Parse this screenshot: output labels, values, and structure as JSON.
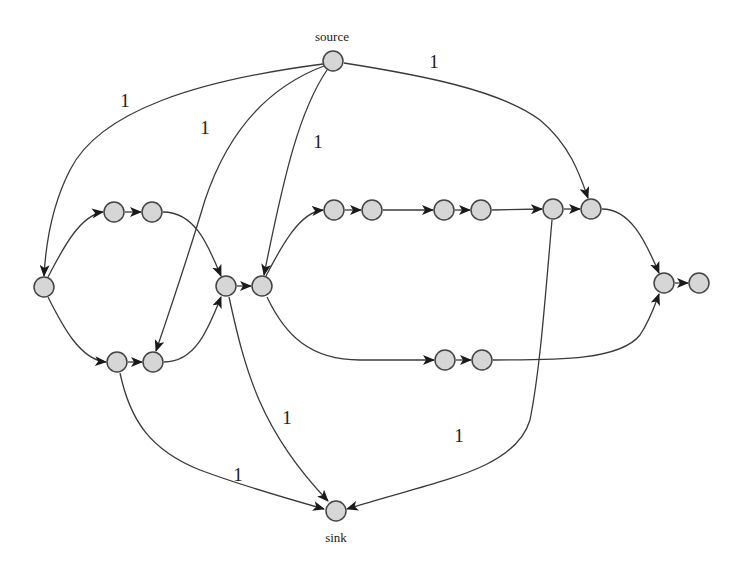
{
  "diagram": {
    "type": "directed-graph",
    "colors": {
      "node_fill": "#d6d6d6",
      "node_stroke": "#444444",
      "edge": "#3a3a3a",
      "background": "#ffffff"
    },
    "nodes": [
      {
        "id": "source",
        "label": "source",
        "x": 333,
        "y": 61
      },
      {
        "id": "a",
        "label": "",
        "x": 44,
        "y": 287
      },
      {
        "id": "b1",
        "label": "",
        "x": 114,
        "y": 212
      },
      {
        "id": "b2",
        "label": "",
        "x": 152,
        "y": 212
      },
      {
        "id": "c1",
        "label": "",
        "x": 117,
        "y": 362
      },
      {
        "id": "c2",
        "label": "",
        "x": 153,
        "y": 362
      },
      {
        "id": "d",
        "label": "",
        "x": 226,
        "y": 286
      },
      {
        "id": "e",
        "label": "",
        "x": 262,
        "y": 286
      },
      {
        "id": "f1",
        "label": "",
        "x": 334,
        "y": 210
      },
      {
        "id": "f2",
        "label": "",
        "x": 372,
        "y": 210
      },
      {
        "id": "g1",
        "label": "",
        "x": 444,
        "y": 210
      },
      {
        "id": "g2",
        "label": "",
        "x": 481,
        "y": 210
      },
      {
        "id": "h1",
        "label": "",
        "x": 553,
        "y": 209
      },
      {
        "id": "h2",
        "label": "",
        "x": 591,
        "y": 209
      },
      {
        "id": "i1",
        "label": "",
        "x": 445,
        "y": 360
      },
      {
        "id": "i2",
        "label": "",
        "x": 482,
        "y": 360
      },
      {
        "id": "j1",
        "label": "",
        "x": 664,
        "y": 283
      },
      {
        "id": "j2",
        "label": "",
        "x": 699,
        "y": 283
      },
      {
        "id": "sink",
        "label": "sink",
        "x": 336,
        "y": 511
      }
    ],
    "edges": [
      {
        "from": "source",
        "to": "a",
        "label": "1"
      },
      {
        "from": "source",
        "to": "c2",
        "label": "1"
      },
      {
        "from": "source",
        "to": "e",
        "label": "1"
      },
      {
        "from": "source",
        "to": "h2",
        "label": "1"
      },
      {
        "from": "a",
        "to": "b1",
        "label": ""
      },
      {
        "from": "a",
        "to": "c1",
        "label": ""
      },
      {
        "from": "b1",
        "to": "b2",
        "label": ""
      },
      {
        "from": "c1",
        "to": "c2",
        "label": ""
      },
      {
        "from": "b2",
        "to": "d",
        "label": ""
      },
      {
        "from": "c2",
        "to": "d",
        "label": ""
      },
      {
        "from": "d",
        "to": "e",
        "label": ""
      },
      {
        "from": "e",
        "to": "f1",
        "label": ""
      },
      {
        "from": "e",
        "to": "i1",
        "label": ""
      },
      {
        "from": "f1",
        "to": "f2",
        "label": ""
      },
      {
        "from": "f2",
        "to": "g1",
        "label": ""
      },
      {
        "from": "g1",
        "to": "g2",
        "label": ""
      },
      {
        "from": "g2",
        "to": "h1",
        "label": ""
      },
      {
        "from": "h1",
        "to": "h2",
        "label": ""
      },
      {
        "from": "h2",
        "to": "j1",
        "label": ""
      },
      {
        "from": "i1",
        "to": "i2",
        "label": ""
      },
      {
        "from": "i2",
        "to": "j1",
        "label": ""
      },
      {
        "from": "j1",
        "to": "j2",
        "label": ""
      },
      {
        "from": "c1",
        "to": "sink",
        "label": "1"
      },
      {
        "from": "d",
        "to": "sink",
        "label": "1"
      },
      {
        "from": "h1",
        "to": "sink",
        "label": "1"
      }
    ],
    "edge_labels": {
      "source_a": "1",
      "source_c2": "1",
      "source_e": "1",
      "source_h2": "1",
      "d_sink": "1",
      "c1_sink": "1",
      "h1_sink": "1"
    },
    "node_labels": {
      "source": "source",
      "sink": "sink"
    }
  }
}
